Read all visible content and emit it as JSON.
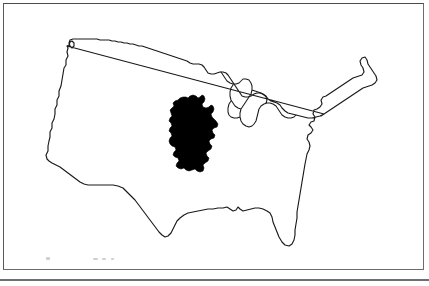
{
  "figure": {
    "caption": "",
    "background_color": "#ffffff",
    "frame_color": "#6b6b6b"
  },
  "map": {
    "base_region_name": "Contiguous United States",
    "base_region_style": "outline",
    "base_outline_color": "#1a1a1a",
    "overlay_region_name": "Germany",
    "overlay_style": "filled silhouette",
    "overlay_fill_color": "#000000",
    "features": [
      {
        "name": "us-national-outline",
        "type": "outline"
      },
      {
        "name": "great-lakes",
        "type": "outline"
      },
      {
        "name": "germany-silhouette",
        "type": "filled"
      }
    ]
  },
  "legend": {
    "scale_marks_visible": true,
    "scale_marks_legible": false
  }
}
